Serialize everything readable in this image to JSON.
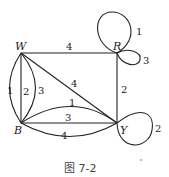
{
  "caption": "图 7-2",
  "nodes": {
    "W": {
      "label": "W",
      "x": 21,
      "y": 53
    },
    "R": {
      "label": "R",
      "x": 117,
      "y": 53
    },
    "B": {
      "label": "B",
      "x": 21,
      "y": 123
    },
    "Y": {
      "label": "Y",
      "x": 117,
      "y": 123
    }
  },
  "edges": [
    {
      "id": "W-R",
      "from": "W",
      "to": "R",
      "label": "4"
    },
    {
      "id": "W-B-1",
      "from": "W",
      "to": "B",
      "label": "1"
    },
    {
      "id": "W-B-2",
      "from": "W",
      "to": "B",
      "label": "2"
    },
    {
      "id": "W-B-3",
      "from": "W",
      "to": "B",
      "label": "3"
    },
    {
      "id": "W-Y",
      "from": "W",
      "to": "Y",
      "label": "4"
    },
    {
      "id": "R-Y",
      "from": "R",
      "to": "Y",
      "label": "2"
    },
    {
      "id": "B-Y-1",
      "from": "B",
      "to": "Y",
      "label": "1"
    },
    {
      "id": "B-Y-3",
      "from": "B",
      "to": "Y",
      "label": "3"
    },
    {
      "id": "B-Y-4",
      "from": "B",
      "to": "Y",
      "label": "4"
    },
    {
      "id": "R-loop-1",
      "from": "R",
      "to": "R",
      "label": "1"
    },
    {
      "id": "R-loop-3",
      "from": "R",
      "to": "R",
      "label": "3"
    },
    {
      "id": "Y-loop-2",
      "from": "Y",
      "to": "Y",
      "label": "2"
    }
  ]
}
